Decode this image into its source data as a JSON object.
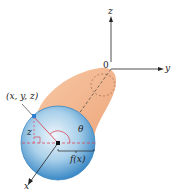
{
  "diagram": {
    "labels": {
      "z_axis": "z",
      "y_axis": "y",
      "x_axis": "x",
      "origin": "0",
      "point": "(x, y, z)",
      "height": "z",
      "angle": "θ",
      "radius": "f(x)"
    },
    "colors": {
      "solid": "#f2b58c",
      "solid_edge": "#d98a5a",
      "disk_center": "#e6f2fa",
      "disk_edge": "#3c8cc8",
      "red_lines": "#d9485a",
      "point": "#2f7fd0",
      "axes": "#222222"
    }
  }
}
